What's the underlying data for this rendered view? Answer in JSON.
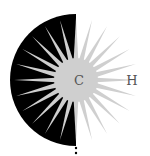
{
  "diagram": {
    "type": "sunburst-half-disc",
    "center": {
      "x": 76,
      "y": 80
    },
    "half_disc": {
      "radius": 66,
      "side": "left",
      "color": "#000000"
    },
    "sunburst": {
      "core_radius": 20,
      "spike_length": 62,
      "spike_count": 24,
      "color": "#cfcfcf"
    },
    "labels": {
      "center": "C",
      "right": "H"
    },
    "dots": [
      {
        "x": 76,
        "y": 148
      },
      {
        "x": 76,
        "y": 153
      }
    ]
  }
}
